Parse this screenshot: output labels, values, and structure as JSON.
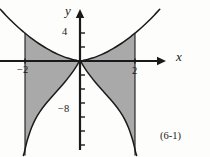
{
  "figure": {
    "caption": "(6-1)",
    "background_color": "#fdfdfb",
    "curve_color": "#1a1a1a",
    "shade_color": "#a9a9a9"
  },
  "axes": {
    "x_label": "x",
    "y_label": "y",
    "origin_px": {
      "x": 80,
      "y": 61
    },
    "x_unit_px": 27.5,
    "y_unit_px": 7.0,
    "x_range": [
      -2.9,
      3.1
    ],
    "y_range": [
      -13.5,
      7.6
    ],
    "x_ticks": [
      {
        "value": -2,
        "label": "−2"
      },
      {
        "value": 2,
        "label": "2"
      }
    ],
    "y_ticks": [
      {
        "value": 4,
        "label": "4"
      },
      {
        "value": 2,
        "label": ""
      },
      {
        "value": -2,
        "label": ""
      },
      {
        "value": -4,
        "label": ""
      },
      {
        "value": -6,
        "label": ""
      },
      {
        "value": -8,
        "label": "−8"
      },
      {
        "value": -10,
        "label": ""
      },
      {
        "value": -12,
        "label": ""
      }
    ]
  },
  "chart_data": {
    "type": "line",
    "title": "",
    "xlabel": "x",
    "ylabel": "y",
    "xlim": [
      -2.9,
      3.1
    ],
    "ylim": [
      -13.5,
      7.6
    ],
    "grid": false,
    "legend": "none",
    "series": [
      {
        "name": "upper-left-branch",
        "x": [
          -2.9,
          -2.7,
          -2.5,
          -2.3,
          -2.1,
          -2.0,
          -1.8,
          -1.6,
          -1.4,
          -1.2,
          -1.0,
          -0.8,
          -0.6,
          -0.45,
          -0.3,
          -0.18,
          -0.09,
          -0.03
        ],
        "y": [
          7.4,
          6.55,
          5.75,
          5.0,
          4.3,
          3.98,
          3.35,
          2.78,
          2.25,
          1.76,
          1.32,
          0.94,
          0.62,
          0.42,
          0.25,
          0.13,
          0.05,
          0.01
        ]
      },
      {
        "name": "upper-right-branch",
        "x": [
          0.03,
          0.09,
          0.18,
          0.3,
          0.45,
          0.6,
          0.8,
          1.0,
          1.2,
          1.4,
          1.6,
          1.8,
          2.0,
          2.1,
          2.3,
          2.5,
          2.7,
          2.9
        ],
        "y": [
          0.01,
          0.05,
          0.13,
          0.25,
          0.42,
          0.62,
          0.94,
          1.32,
          1.76,
          2.25,
          2.78,
          3.35,
          3.98,
          4.3,
          5.0,
          5.75,
          6.55,
          7.4
        ]
      },
      {
        "name": "lower-left-branch",
        "x": [
          -0.02,
          -0.06,
          -0.12,
          -0.22,
          -0.36,
          -0.55,
          -0.78,
          -1.02,
          -1.25,
          -1.45,
          -1.62,
          -1.76,
          -1.86,
          -1.93,
          -1.98,
          -2.02,
          -2.06
        ],
        "y": [
          -0.05,
          -0.28,
          -0.7,
          -1.3,
          -2.05,
          -3.0,
          -4.05,
          -5.1,
          -6.15,
          -7.2,
          -8.3,
          -9.5,
          -10.6,
          -11.5,
          -12.3,
          -13.0,
          -13.5
        ]
      },
      {
        "name": "lower-right-branch",
        "x": [
          0.02,
          0.06,
          0.12,
          0.22,
          0.36,
          0.55,
          0.78,
          1.02,
          1.25,
          1.45,
          1.62,
          1.76,
          1.86,
          1.93,
          1.98,
          2.02,
          2.06
        ],
        "y": [
          -0.05,
          -0.28,
          -0.7,
          -1.3,
          -2.05,
          -3.0,
          -4.05,
          -5.1,
          -6.15,
          -7.2,
          -8.3,
          -9.5,
          -10.6,
          -11.5,
          -12.3,
          -13.0,
          -13.5
        ]
      }
    ],
    "vertical_boundaries": [
      {
        "x": -2,
        "y_top": 3.98,
        "y_bottom": -13.5
      },
      {
        "x": 2,
        "y_top": 3.98,
        "y_bottom": -13.5
      }
    ],
    "shaded_regions": [
      {
        "name": "upper-left-shade",
        "x_from": -2,
        "x_to": 0,
        "between": [
          "upper-left-branch",
          "x-axis"
        ]
      },
      {
        "name": "upper-right-shade",
        "x_from": 0,
        "x_to": 2,
        "between": [
          "upper-right-branch",
          "x-axis"
        ]
      },
      {
        "name": "lower-left-shade",
        "x_from": -2,
        "x_to": 0,
        "between": [
          "x-axis",
          "lower-left-branch"
        ]
      },
      {
        "name": "lower-right-shade",
        "x_from": 0,
        "x_to": 2,
        "between": [
          "x-axis",
          "lower-right-branch"
        ]
      }
    ]
  }
}
